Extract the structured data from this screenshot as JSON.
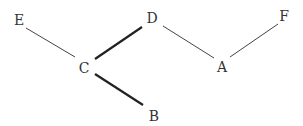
{
  "diagram": {
    "type": "tree",
    "nodes": [
      {
        "id": "E",
        "label": "E",
        "x": 19,
        "y": 20
      },
      {
        "id": "D",
        "label": "D",
        "x": 152,
        "y": 18
      },
      {
        "id": "F",
        "label": "F",
        "x": 284,
        "y": 16
      },
      {
        "id": "C",
        "label": "C",
        "x": 84,
        "y": 68
      },
      {
        "id": "A",
        "label": "A",
        "x": 222,
        "y": 67
      },
      {
        "id": "B",
        "label": "B",
        "x": 154,
        "y": 116
      }
    ],
    "edges": [
      {
        "from": "E",
        "to": "C",
        "bold": false
      },
      {
        "from": "C",
        "to": "D",
        "bold": true
      },
      {
        "from": "C",
        "to": "B",
        "bold": true
      },
      {
        "from": "D",
        "to": "A",
        "bold": false
      },
      {
        "from": "A",
        "to": "F",
        "bold": false
      }
    ],
    "colors": {
      "line": "#333333",
      "text": "#333333"
    }
  }
}
